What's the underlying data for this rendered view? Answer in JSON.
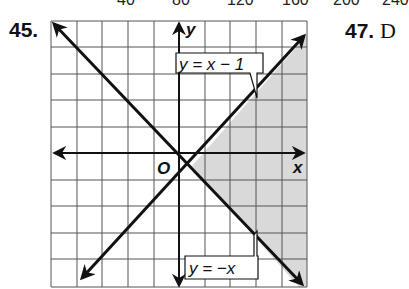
{
  "top_ticks": [
    "40",
    "80",
    "120",
    "160",
    "200",
    "240"
  ],
  "problems": {
    "left": {
      "number": "45."
    },
    "right": {
      "number": "47.",
      "letter": "D"
    }
  },
  "graph": {
    "x_axis_label": "x",
    "y_axis_label": "y",
    "origin_label": "O",
    "grid": {
      "xmin": -5,
      "xmax": 5,
      "ymin": -5,
      "ymax": 5
    },
    "lines": [
      {
        "equation": "y = x − 1",
        "slope": 1,
        "intercept": -1
      },
      {
        "equation": "y = −x",
        "slope": -1,
        "intercept": 0
      }
    ],
    "shaded_region": "y ≤ x − 1 and y ≥ −x",
    "shade_color": "#d9d9d9"
  }
}
